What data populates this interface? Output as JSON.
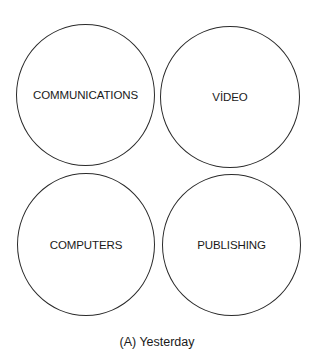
{
  "diagram": {
    "circles": [
      {
        "label": "COMMUNICATIONS"
      },
      {
        "label": "VİDEO"
      },
      {
        "label": "COMPUTERS"
      },
      {
        "label": "PUBLISHING"
      }
    ],
    "caption": "(A) Yesterday"
  }
}
